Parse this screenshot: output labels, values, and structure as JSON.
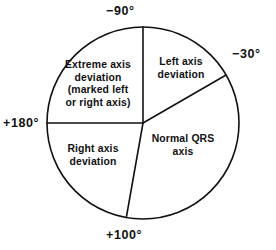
{
  "figure": {
    "type": "hexaxial-reference-diagram",
    "background_color": "#ffffff",
    "stroke_color": "#111111",
    "geometry": {
      "center_x": 143,
      "center_y": 123,
      "radius": 96
    }
  },
  "axis_labels": {
    "top": "−90°",
    "right": "−30°",
    "left": "+180°",
    "bottom": "+100°"
  },
  "sectors": [
    {
      "id": "extreme-axis-deviation",
      "label": "Extreme axis\ndeviation\n(marked left\nor right axis)",
      "start_deg": -90,
      "end_deg": 180
    },
    {
      "id": "left-axis-deviation",
      "label": "Left axis\ndeviation",
      "start_deg": -90,
      "end_deg": -30
    },
    {
      "id": "normal-qrs-axis",
      "label": "Normal QRS\naxis",
      "start_deg": -30,
      "end_deg": 100
    },
    {
      "id": "right-axis-deviation",
      "label": "Right axis\ndeviation",
      "start_deg": 100,
      "end_deg": 180
    }
  ],
  "radii": [
    {
      "id": "radius-minus-90",
      "angle_deg": -90
    },
    {
      "id": "radius-minus-30",
      "angle_deg": -30
    },
    {
      "id": "radius-plus-180",
      "angle_deg": 180
    },
    {
      "id": "radius-plus-100",
      "angle_deg": 100
    }
  ]
}
